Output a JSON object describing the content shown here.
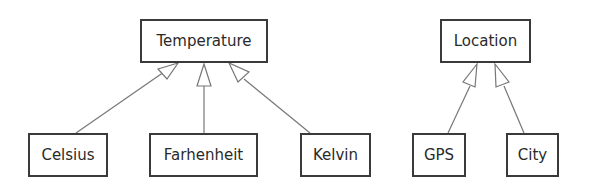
{
  "diagram": {
    "type": "uml-class-inheritance",
    "colors": {
      "stroke": "#3a3a3a",
      "link": "#777777",
      "text": "#2a2a2a",
      "background": "#ffffff"
    },
    "classes": [
      {
        "id": "temperature",
        "label": "Temperature",
        "x": 140,
        "y": 19,
        "w": 128,
        "h": 44
      },
      {
        "id": "celsius",
        "label": "Celsius",
        "x": 28,
        "y": 133,
        "w": 80,
        "h": 44
      },
      {
        "id": "farhenheit",
        "label": "Farhenheit",
        "x": 149,
        "y": 133,
        "w": 109,
        "h": 44
      },
      {
        "id": "kelvin",
        "label": "Kelvin",
        "x": 300,
        "y": 133,
        "w": 71,
        "h": 44
      },
      {
        "id": "location",
        "label": "Location",
        "x": 440,
        "y": 19,
        "w": 91,
        "h": 44
      },
      {
        "id": "gps",
        "label": "GPS",
        "x": 412,
        "y": 133,
        "w": 54,
        "h": 44
      },
      {
        "id": "city",
        "label": "City",
        "x": 506,
        "y": 133,
        "w": 53,
        "h": 44
      }
    ],
    "generalizations": [
      {
        "child": "celsius",
        "parent": "temperature"
      },
      {
        "child": "farhenheit",
        "parent": "temperature"
      },
      {
        "child": "kelvin",
        "parent": "temperature"
      },
      {
        "child": "gps",
        "parent": "location"
      },
      {
        "child": "city",
        "parent": "location"
      }
    ]
  }
}
